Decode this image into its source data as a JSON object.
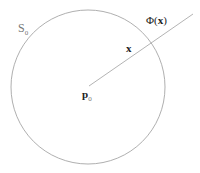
{
  "diagram": {
    "circle": {
      "cx": 88,
      "cy": 87,
      "r": 77,
      "stroke": "#9a9a9a"
    },
    "ray": {
      "x1": 89,
      "y1": 86,
      "x2": 193,
      "y2": 14,
      "stroke": "#a0a0a0"
    },
    "labels": {
      "sphere": {
        "main": "S",
        "sub": "0"
      },
      "point_x": "x",
      "center": {
        "main": "p",
        "sub": "0"
      },
      "phi": {
        "prefix": "Φ(",
        "arg": "x",
        "suffix": ")"
      }
    }
  }
}
